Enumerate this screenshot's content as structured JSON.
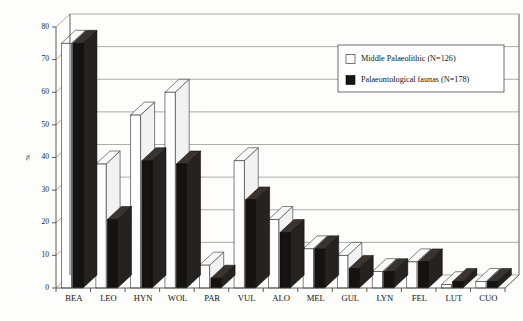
{
  "chart_data": {
    "type": "bar",
    "title": "",
    "subtitle": "",
    "xlabel": "",
    "ylabel": "%",
    "ylim": [
      0,
      80
    ],
    "yticks": [
      0,
      10,
      20,
      30,
      40,
      50,
      60,
      70,
      80
    ],
    "grid": true,
    "grid_axis": "y",
    "style": "3d-grouped-bars",
    "legend_position": "top-right",
    "categories": [
      "BEA",
      "LEO",
      "HYN",
      "WOL",
      "PAR",
      "VUL",
      "ALO",
      "MEL",
      "GUL",
      "LYN",
      "FEL",
      "LUT",
      "CUO"
    ],
    "series": [
      {
        "name": "Middle Palaeolithic (N=126)",
        "color": "#ffffff",
        "values": [
          75,
          38,
          53,
          60,
          7,
          39,
          21,
          12,
          10,
          5,
          8,
          1,
          2
        ]
      },
      {
        "name": "Palaeontological faunas (N=178)",
        "color": "#151210",
        "values": [
          75,
          21,
          39,
          38,
          3,
          27,
          17,
          12,
          6,
          5,
          8,
          2,
          2
        ]
      }
    ]
  },
  "legend": {
    "entries": [
      {
        "label": "Middle Palaeolithic (N=126)",
        "swatch": "white"
      },
      {
        "label": "Palaeontological faunas (N=178)",
        "swatch": "black"
      }
    ]
  },
  "axes": {
    "y_axis_label": "%",
    "y_tick_labels": [
      "0",
      "10",
      "20",
      "30",
      "40",
      "50",
      "60",
      "70",
      "80"
    ],
    "x_tick_labels": [
      "BEA",
      "LEO",
      "HYN",
      "WOL",
      "PAR",
      "VUL",
      "ALO",
      "MEL",
      "GUL",
      "LYN",
      "FEL",
      "LUT",
      "CUO"
    ]
  }
}
